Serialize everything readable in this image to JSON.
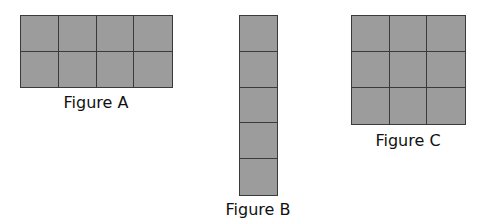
{
  "figures": [
    {
      "id": "A",
      "label": "Figure A",
      "columns": 4,
      "rows": 2,
      "square_count": 8
    },
    {
      "id": "B",
      "label": "Figure B",
      "columns": 1,
      "rows": 5,
      "square_count": 5
    },
    {
      "id": "C",
      "label": "Figure C",
      "columns": 3,
      "rows": 3,
      "square_count": 9
    }
  ],
  "colors": {
    "fill": "#9c9c9c",
    "grid_line": "#3a3a3a",
    "label_text": "#111111",
    "background": "#ffffff"
  }
}
